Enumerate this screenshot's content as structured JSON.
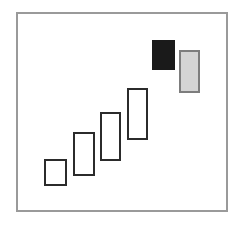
{
  "diagram": {
    "background_color": "#ffffff",
    "frame": {
      "name": "outer-frame",
      "x": 16,
      "y": 12,
      "width": 212,
      "height": 200,
      "border_color": "#9a9a9a",
      "border_width": 2,
      "fill": "#ffffff"
    },
    "colors": {
      "outline_stroke": "#2b2b2b",
      "outline_fill": "#ffffff",
      "solid_fill": "#1a1a1a",
      "solid_stroke": "#1a1a1a",
      "gray_fill": "#d4d4d4",
      "gray_stroke": "#7d7d7d",
      "frame_stroke": "#9a9a9a"
    },
    "shapes": [
      {
        "name": "bar-1",
        "style": "outline",
        "x": 44,
        "y": 159,
        "width": 23,
        "height": 27,
        "fill": "#ffffff",
        "stroke": "#2b2b2b",
        "stroke_width": 2
      },
      {
        "name": "bar-2",
        "style": "outline",
        "x": 73,
        "y": 132,
        "width": 22,
        "height": 44,
        "fill": "#ffffff",
        "stroke": "#2b2b2b",
        "stroke_width": 2
      },
      {
        "name": "bar-3",
        "style": "outline",
        "x": 100,
        "y": 112,
        "width": 21,
        "height": 49,
        "fill": "#ffffff",
        "stroke": "#2b2b2b",
        "stroke_width": 2
      },
      {
        "name": "bar-4",
        "style": "outline",
        "x": 127,
        "y": 88,
        "width": 21,
        "height": 52,
        "fill": "#ffffff",
        "stroke": "#2b2b2b",
        "stroke_width": 2
      },
      {
        "name": "bar-5-black",
        "style": "solid",
        "x": 152,
        "y": 40,
        "width": 23,
        "height": 30,
        "fill": "#1a1a1a",
        "stroke": "#1a1a1a",
        "stroke_width": 2
      },
      {
        "name": "bar-6-gray",
        "style": "gray",
        "x": 179,
        "y": 50,
        "width": 21,
        "height": 43,
        "fill": "#d4d4d4",
        "stroke": "#7d7d7d",
        "stroke_width": 2
      }
    ]
  }
}
